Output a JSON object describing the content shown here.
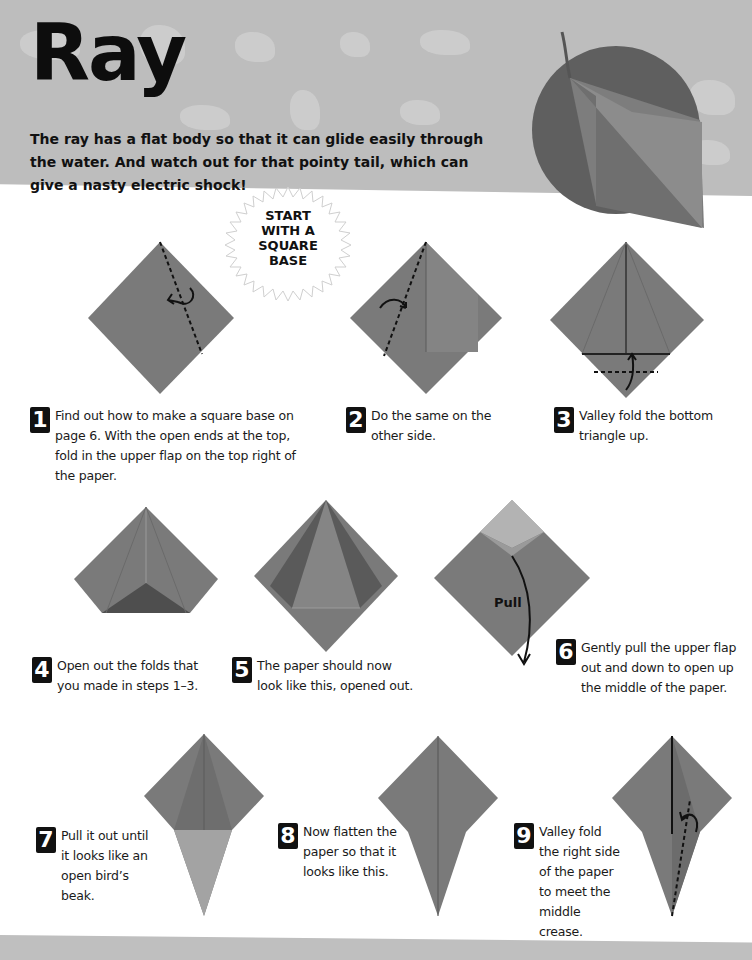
{
  "page": {
    "title": "Ray",
    "intro": "The ray has a flat body so that it can glide easily through the water. And watch out for that pointy tail, which can give a nasty electric shock!",
    "start_badge": [
      "START",
      "WITH A",
      "SQUARE",
      "BASE"
    ],
    "pull_label": "Pull"
  },
  "colors": {
    "header_band": "#bdbdbd",
    "paper": "#7a7a7a",
    "paper_light": "#9a9a9a",
    "paper_dark": "#555555",
    "hero_circle": "#5f5f5f",
    "number_box": "#111111"
  },
  "steps": [
    {
      "number": "1",
      "text": "Find out how to make a square base on page 6. With the open ends at the top, fold in the upper flap on the top right of the paper."
    },
    {
      "number": "2",
      "text": "Do the same on the other side."
    },
    {
      "number": "3",
      "text": "Valley fold the bottom triangle up."
    },
    {
      "number": "4",
      "text": "Open out the folds that you made in steps 1–3."
    },
    {
      "number": "5",
      "text": "The paper should now look like this, opened out."
    },
    {
      "number": "6",
      "text": "Gently pull the upper flap out and down to open up the middle of the paper."
    },
    {
      "number": "7",
      "text": "Pull it out until it looks like an open bird’s beak."
    },
    {
      "number": "8",
      "text": "Now flatten the paper so that it looks like this."
    },
    {
      "number": "9",
      "text": "Valley fold the right side of the paper to meet the middle crease."
    }
  ]
}
